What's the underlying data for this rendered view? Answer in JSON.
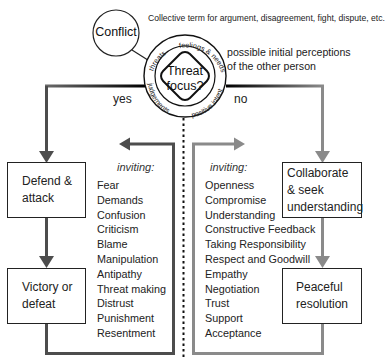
{
  "conflict": {
    "label": "Conflict",
    "description": "Collective term for argument, disagreement, fight, dispute, etc."
  },
  "threat_focus": {
    "line1": "Threat",
    "line2": "focus?",
    "ring_labels": [
      "threats",
      "feelings & needs",
      "positive intent",
      "judgements"
    ],
    "perceptions_note_line1": "possible initial perceptions",
    "perceptions_note_line2": "of the other person"
  },
  "branches": {
    "yes_label": "yes",
    "no_label": "no"
  },
  "left_path": {
    "box1_line1": "Defend &",
    "box1_line2": "attack",
    "box2_line1": "Victory or",
    "box2_line2": "defeat",
    "inviting_label": "inviting:",
    "items": [
      "Fear",
      "Demands",
      "Confusion",
      "Criticism",
      "Blame",
      "Manipulation",
      "Antipathy",
      "Threat making",
      "Distrust",
      "Punishment",
      "Resentment"
    ]
  },
  "right_path": {
    "box1_line1": "Collaborate",
    "box1_line2": "& seek",
    "box1_line3": "understanding",
    "box2_line1": "Peaceful",
    "box2_line2": "resolution",
    "inviting_label": "inviting:",
    "items": [
      "Openness",
      "Compromise",
      "Understanding",
      "Constructive Feedback",
      "Taking Responsibility",
      "Respect and Goodwill",
      "Empathy",
      "Negotiation",
      "Trust",
      "Support",
      "Acceptance"
    ]
  },
  "colors": {
    "left_path": "#4d4d4d",
    "right_path": "#8a8a8a",
    "stroke": "#1a1a1a"
  }
}
